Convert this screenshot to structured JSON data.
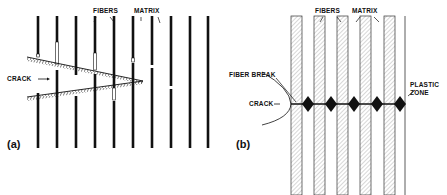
{
  "figure": {
    "panel_a": {
      "label": "(a)",
      "annotations": {
        "fibers": "FIBERS",
        "matrix": "MATRIX",
        "crack": "CRACK"
      },
      "fiber_count": 10
    },
    "panel_b": {
      "label": "(b)",
      "annotations": {
        "fibers": "FIBERS",
        "matrix": "MATRIX",
        "fiber_break": "FIBER BREAK",
        "crack": "CRACK",
        "plastic_zone_line1": "PLASTIC",
        "plastic_zone_line2": "ZONE"
      },
      "fiber_strip_count": 5,
      "plastic_zone_count": 5
    },
    "colors": {
      "ink": "#111111",
      "hatch": "#9a9a9a",
      "background": "#ffffff"
    }
  }
}
